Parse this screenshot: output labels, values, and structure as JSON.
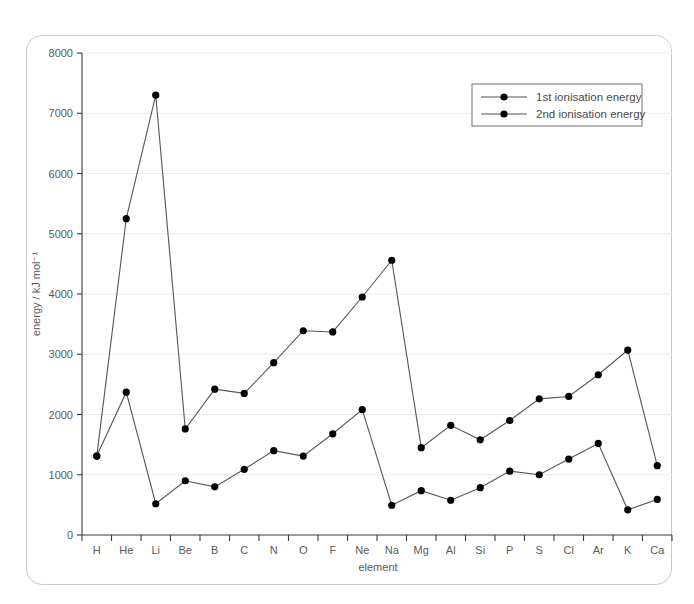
{
  "chart_data": {
    "type": "line",
    "title": "",
    "xlabel": "element",
    "ylabel": "energy / kJ mol⁻¹",
    "ylim": [
      0,
      8000
    ],
    "ytick_step": 1000,
    "yticks": [
      "0",
      "1000",
      "2000",
      "3000",
      "4000",
      "5000",
      "6000",
      "7000",
      "8000"
    ],
    "grid": "horizontal",
    "legend_position": "top-right",
    "categories": [
      "H",
      "He",
      "Li",
      "Be",
      "B",
      "C",
      "N",
      "O",
      "F",
      "Ne",
      "Na",
      "Mg",
      "Al",
      "Si",
      "P",
      "S",
      "Cl",
      "Ar",
      "K",
      "Ca"
    ],
    "series": [
      {
        "name": "1st ionisation energy",
        "color": "#000000",
        "values": [
          1310,
          2370,
          519,
          900,
          799,
          1090,
          1400,
          1310,
          1680,
          2080,
          494,
          736,
          577,
          786,
          1060,
          1000,
          1260,
          1520,
          418,
          590
        ]
      },
      {
        "name": "2nd ionisation energy",
        "color": "#000000",
        "values": [
          1310,
          5250,
          7300,
          1760,
          2420,
          2350,
          2860,
          3390,
          3370,
          3950,
          4560,
          1450,
          1820,
          1580,
          1900,
          2260,
          2300,
          2660,
          3070,
          1150
        ]
      }
    ]
  },
  "legend": {
    "entries": [
      {
        "label": "1st ionisation energy"
      },
      {
        "label": "2nd ionisation energy"
      }
    ]
  },
  "axes": {
    "x_title": "element",
    "y_title": "energy / kJ mol⁻¹"
  }
}
